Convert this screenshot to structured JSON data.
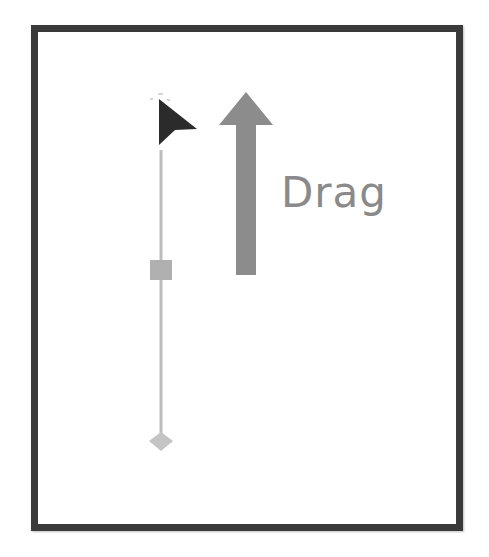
{
  "diagram": {
    "label": "Drag",
    "colors": {
      "frame": "#3a3a3a",
      "cursor": "#2b2b2b",
      "arrow": "#8c8c8c",
      "track": "#bdbdbd",
      "handle": "#b0b0b0",
      "text": "#8a8a8a"
    },
    "icons": {
      "cursor": "mouse-pointer-icon",
      "arrow": "arrow-up-icon",
      "handle": "square-handle",
      "end_marker": "diamond-end-icon"
    }
  }
}
